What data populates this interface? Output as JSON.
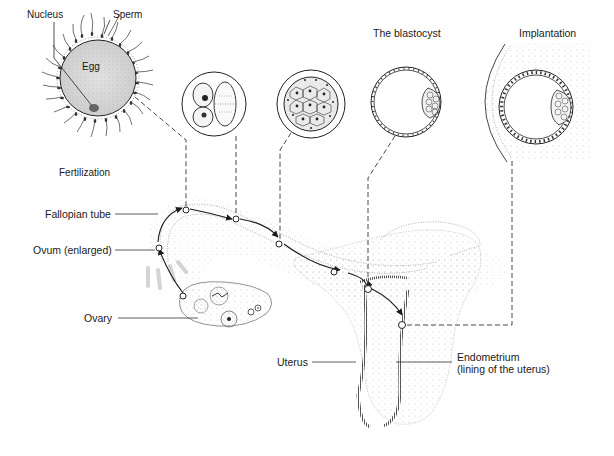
{
  "diagram": {
    "type": "biological-process",
    "stages": [
      {
        "id": "fertilization",
        "label": "Fertilization",
        "sub_labels": [
          "Nucleus",
          "Sperm",
          "Egg"
        ]
      },
      {
        "id": "two-cell",
        "label": ""
      },
      {
        "id": "morula",
        "label": ""
      },
      {
        "id": "blastocyst",
        "label": "The blastocyst"
      },
      {
        "id": "implantation",
        "label": "Implantation"
      }
    ],
    "anatomy_labels": {
      "fallopian_tube": "Fallopian tube",
      "ovum": "Ovum (enlarged)",
      "ovary": "Ovary",
      "uterus": "Uterus",
      "endometrium_line1": "Endometrium",
      "endometrium_line2": "(lining of the uterus)"
    },
    "top_labels": {
      "nucleus": "Nucleus",
      "sperm": "Sperm",
      "egg": "Egg",
      "fertilization": "Fertilization",
      "blastocyst": "The blastocyst",
      "implantation": "Implantation"
    },
    "colors": {
      "ink": "#1a1a1a",
      "stipple": "#8a8a8a",
      "background": "#ffffff"
    }
  }
}
